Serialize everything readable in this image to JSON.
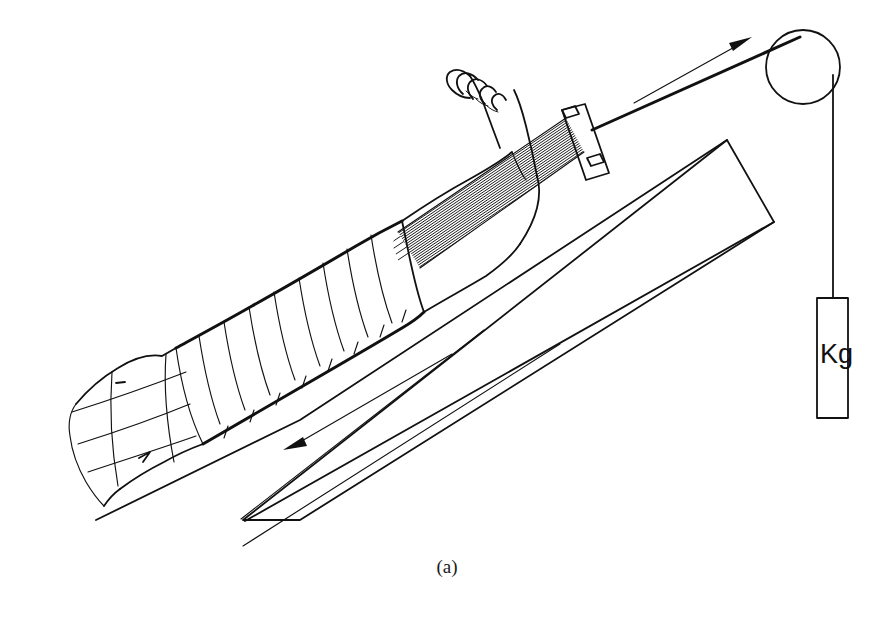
{
  "figure": {
    "caption": "(a)",
    "kind": "medical-line-diagram",
    "background_color": "#ffffff",
    "ink_color": "#111111"
  },
  "labels": {
    "weight_label": "Kg"
  },
  "parts": {
    "bed_board": "inclined bed board",
    "patient_torso": "patient pelvis and torso",
    "bandaged_thigh": "bandaged thigh and knee",
    "lower_leg": "lower leg",
    "foot": "foot with toes",
    "traction_straps": "adhesive traction straps",
    "spreader_bar": "spreader bar",
    "traction_cord": "traction cord",
    "pulley": "pulley wheel",
    "hanging_cord": "vertical hanging cord",
    "weight": "suspended weight"
  },
  "annotations": [
    {
      "name": "traction-force-arrow",
      "direction": "up-right",
      "meaning": "direction of traction pull toward the pulley"
    },
    {
      "name": "counter-traction-arrow",
      "direction": "down-left",
      "meaning": "direction of counter-traction along the bed"
    }
  ],
  "geometry": {
    "canvas": {
      "width": 894,
      "height": 622
    },
    "pulley": {
      "cx": 803,
      "cy": 67,
      "r": 37
    },
    "weight_box": {
      "x": 817,
      "y": 298,
      "width": 31,
      "height": 120
    },
    "caption_position": {
      "x": 447,
      "y": 573
    }
  }
}
